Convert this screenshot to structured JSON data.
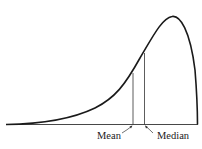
{
  "diagram": {
    "labels": {
      "mean": "Mean",
      "median": "Median"
    },
    "colors": {
      "curve": "#1a1a1a",
      "lines": "#333333",
      "background": "#ffffff"
    }
  }
}
